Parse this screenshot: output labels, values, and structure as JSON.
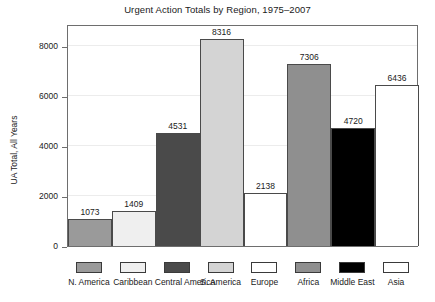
{
  "chart_data": {
    "type": "bar",
    "title": "Urgent Action Totals by Region, 1975–2007",
    "xlabel": "",
    "ylabel": "UA Total, All Years",
    "ylim": [
      0,
      8900
    ],
    "yticks": [
      0,
      2000,
      4000,
      6000,
      8000
    ],
    "ytick_labels": [
      "0",
      "2000",
      "4000",
      "6000",
      "8000"
    ],
    "grid": true,
    "legend_position": "bottom",
    "show_value_labels": true,
    "categories": [
      "N. America",
      "Caribbean",
      "Central America",
      "S. America",
      "Europe",
      "Africa",
      "Middle East",
      "Asia"
    ],
    "values": [
      1073,
      1409,
      4531,
      8316,
      2138,
      7306,
      4720,
      6436
    ],
    "value_labels": [
      "1073",
      "1409",
      "4531",
      "8316",
      "2138",
      "7306",
      "4720",
      "6436"
    ],
    "colors": [
      "#9a9a9a",
      "#efefef",
      "#4a4a4a",
      "#d4d4d4",
      "#ffffff",
      "#8f8f8f",
      "#000000",
      "#ffffff"
    ],
    "bar_edge_color": "#4a4a4a",
    "axis_color": "#6e6e6e",
    "grid_color": "#ececec",
    "text_color": "#1a1a1a",
    "background": "#ffffff"
  }
}
